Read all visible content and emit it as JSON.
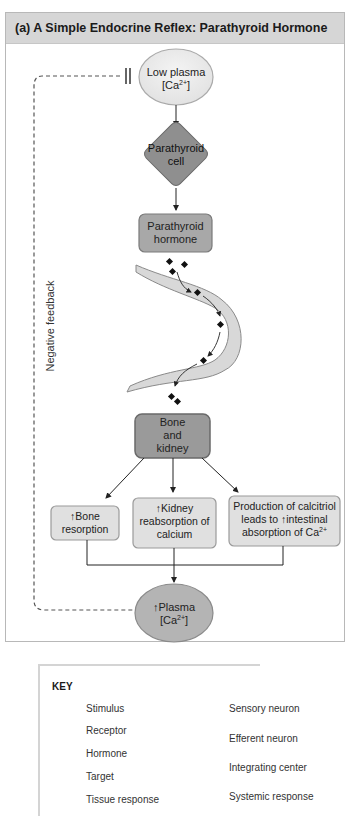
{
  "title": "(a) A Simple Endocrine Reflex: Parathyroid Hormone",
  "side_label": "Negative feedback",
  "nodes": {
    "stimulus": {
      "line1": "Low plasma",
      "line2_pre": "[Ca",
      "line2_sup": "2+",
      "line2_post": "]"
    },
    "integrating_center": {
      "line1": "Parathyroid",
      "line2": "cell"
    },
    "hormone": {
      "line1": "Parathyroid",
      "line2": "hormone"
    },
    "target": {
      "line1": "Bone",
      "line2": "and",
      "line3": "kidney"
    },
    "response_1": {
      "arrow": "↑",
      "line1": "Bone",
      "line2": "resorption"
    },
    "response_2": {
      "arrow": "↑",
      "line1": "Kidney",
      "line2": "reabsorption of",
      "line3": "calcium"
    },
    "response_3": {
      "line1": "Production of calcitriol",
      "line2_pre": "leads to ",
      "arrow": "↑",
      "line2_post": "intestinal",
      "line3_pre": "absorption of Ca",
      "line3_sup": "2+"
    },
    "systemic_response": {
      "arrow": "↑",
      "line1": "Plasma",
      "line2_pre": "[Ca",
      "line2_sup": "2+",
      "line2_post": "]"
    }
  },
  "key": {
    "title": "KEY",
    "items": [
      {
        "label": "Stimulus",
        "shape": "ellipse-light"
      },
      {
        "label": "Receptor",
        "shape": "rect-light"
      },
      {
        "label": "Hormone",
        "shape": "rect-medium"
      },
      {
        "label": "Target",
        "shape": "rect-outlined"
      },
      {
        "label": "Tissue response",
        "shape": "rect-light"
      },
      {
        "label": "Sensory neuron",
        "shape": "neuron"
      },
      {
        "label": "Efferent neuron",
        "shape": "neuron"
      },
      {
        "label": "Integrating center",
        "shape": "diamond"
      },
      {
        "label": "Systemic response",
        "shape": "ellipse-medium"
      }
    ]
  },
  "colors": {
    "title_bar": "#d6d6d6",
    "stimulus_fill": "#ececec",
    "integrating_fill": "#8f8f8f",
    "hormone_fill": "#a8a8a8",
    "target_fill": "#9a9a9a",
    "response_fill": "#e0e0e0",
    "systemic_fill": "#b4b4b4",
    "vessel_fill": "#d8d8d8"
  }
}
